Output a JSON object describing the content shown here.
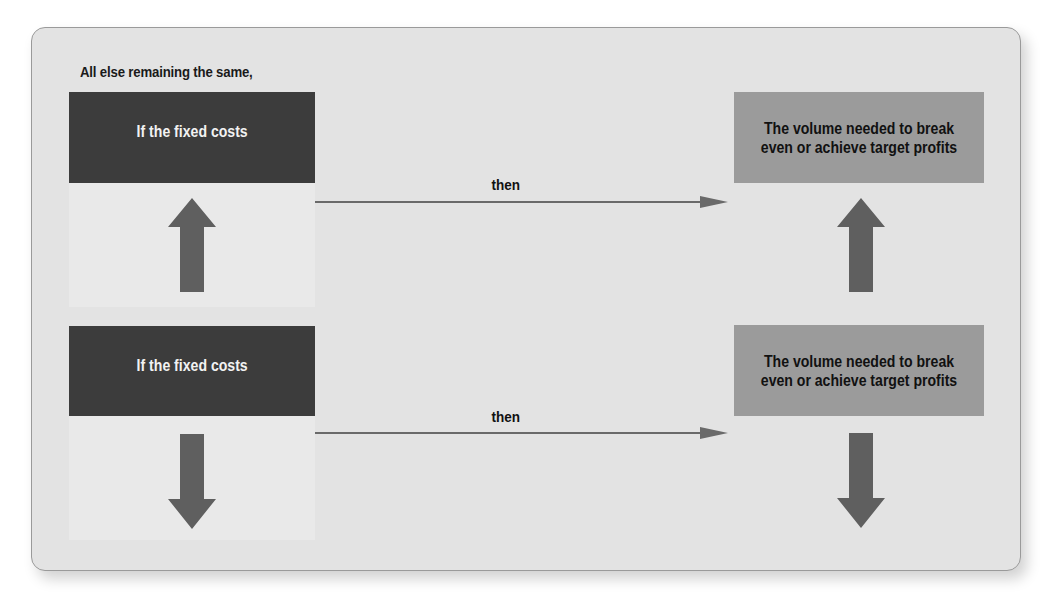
{
  "diagram": {
    "intro": "All else remaining the same,",
    "rows": [
      {
        "direction": "increase",
        "cause": "If the fixed costs",
        "cause_arrow": "up-arrow-icon",
        "connector": "then",
        "effect": "The volume needed to break even or achieve target profits",
        "effect_arrow": "up-arrow-icon"
      },
      {
        "direction": "decrease",
        "cause": "If the fixed costs",
        "cause_arrow": "down-arrow-icon",
        "connector": "then",
        "effect": "The volume needed to break even or achieve target profits",
        "effect_arrow": "down-arrow-icon"
      }
    ],
    "colors": {
      "panel": "#e3e3e3",
      "cause_box": "#3c3c3c",
      "effect_box": "#9b9b9b",
      "arrow": "#5f5f5f"
    }
  }
}
